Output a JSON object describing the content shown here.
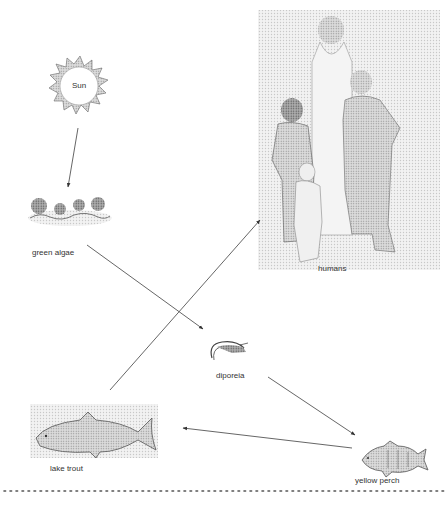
{
  "diagram": {
    "type": "food-chain",
    "nodes": [
      {
        "id": "sun",
        "label": "Sun",
        "icon": "sun-icon"
      },
      {
        "id": "green_algae",
        "label": "green algae",
        "icon": "algae-icon"
      },
      {
        "id": "humans",
        "label": "humans",
        "icon": "humans-family-icon"
      },
      {
        "id": "diporeia",
        "label": "diporeia",
        "icon": "shrimp-icon"
      },
      {
        "id": "lake_trout",
        "label": "lake trout",
        "icon": "trout-fish-icon"
      },
      {
        "id": "yellow_perch",
        "label": "yellow perch",
        "icon": "perch-fish-icon"
      }
    ],
    "edges": [
      {
        "from": "sun",
        "to": "green_algae"
      },
      {
        "from": "green_algae",
        "to": "diporeia"
      },
      {
        "from": "diporeia",
        "to": "yellow_perch"
      },
      {
        "from": "yellow_perch",
        "to": "lake_trout"
      },
      {
        "from": "lake_trout",
        "to": "humans"
      }
    ]
  },
  "labels": {
    "sun": "Sun",
    "green_algae": "green algae",
    "humans": "humans",
    "diporeia": "diporeia",
    "lake_trout": "lake trout",
    "yellow_perch": "yellow perch"
  },
  "colors": {
    "line": "#555555",
    "icon_dark": "#444444",
    "icon_mid": "#888888",
    "icon_light": "#cccccc",
    "background": "#ffffff"
  }
}
